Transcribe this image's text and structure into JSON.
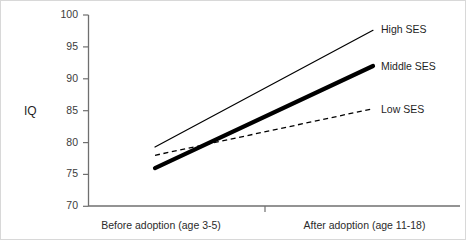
{
  "chart_data": {
    "type": "line",
    "title": "",
    "subtitle": "",
    "xlabel": "",
    "ylabel": "IQ",
    "categories": [
      "Before adoption (age 3-5)",
      "After adoption (age 11-18)"
    ],
    "x": [
      0,
      1
    ],
    "ylim": [
      70,
      100
    ],
    "yticks": [
      70,
      75,
      80,
      85,
      90,
      95,
      100
    ],
    "ytick_labels": [
      "70",
      "75",
      "80",
      "85",
      "90",
      "95",
      "100"
    ],
    "grid": false,
    "legend_position": "line-end-labels",
    "series": [
      {
        "name": "High SES",
        "values": [
          79.3,
          97.6
        ],
        "style": "solid-thin",
        "color": "#000000",
        "width": 1.2
      },
      {
        "name": "Middle SES",
        "values": [
          76.0,
          92.0
        ],
        "style": "solid-thick",
        "color": "#000000",
        "width": 4.2
      },
      {
        "name": "Low SES",
        "values": [
          78.0,
          85.3
        ],
        "style": "dashed",
        "color": "#000000",
        "width": 1.3
      }
    ],
    "annotations": [
      {
        "text": "High SES",
        "attached_to": "High SES"
      },
      {
        "text": "Middle SES",
        "attached_to": "Middle SES"
      },
      {
        "text": "Low SES",
        "attached_to": "Low SES"
      }
    ]
  },
  "axes": {
    "y_title": "IQ",
    "y_ticks": [
      {
        "label": "100"
      },
      {
        "label": "95"
      },
      {
        "label": "90"
      },
      {
        "label": "85"
      },
      {
        "label": "80"
      },
      {
        "label": "75"
      },
      {
        "label": "70"
      }
    ],
    "x_categories": [
      {
        "label": "Before adoption (age 3-5)"
      },
      {
        "label": "After adoption (age 11-18)"
      }
    ]
  },
  "series_labels": {
    "high": "High SES",
    "middle": "Middle SES",
    "low": "Low SES"
  },
  "colors": {
    "line": "#000000",
    "axis": "#6f6f6f",
    "text": "#1f1f1f",
    "frame": "#d8d8d8",
    "background": "#ffffff"
  }
}
